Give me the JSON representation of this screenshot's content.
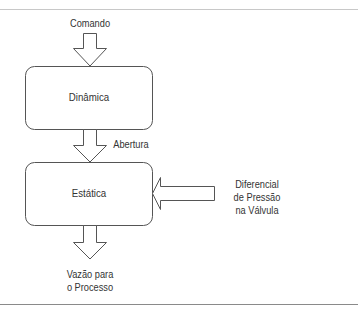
{
  "diagram": {
    "type": "block-flow",
    "blocks": [
      {
        "id": "dinamica",
        "label": "Dinâmica"
      },
      {
        "id": "estatica",
        "label": "Estática"
      }
    ],
    "labels": {
      "input": "Comando",
      "intermediate": "Abertura",
      "disturbance_line1": "Diferencial",
      "disturbance_line2": "de Pressão",
      "disturbance_line3": "na Válvula",
      "output_line1": "Vazão para",
      "output_line2": "o Processo"
    },
    "edges": [
      {
        "from": "Comando",
        "to": "dinamica"
      },
      {
        "from": "dinamica",
        "to": "estatica",
        "label": "Abertura"
      },
      {
        "from": "Diferencial de Pressão na Válvula",
        "to": "estatica"
      },
      {
        "from": "estatica",
        "to": "Vazão para o Processo"
      }
    ],
    "colors": {
      "stroke": "#555555",
      "text": "#333333",
      "fill": "#ffffff"
    }
  }
}
